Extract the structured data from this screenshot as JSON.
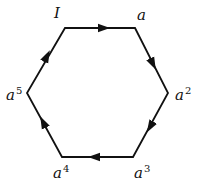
{
  "diagram": {
    "type": "directed-cycle-hexagon",
    "stroke_color": "#111111",
    "vertices": [
      {
        "id": "v0",
        "label": "I",
        "exp": "",
        "x": 65,
        "y": 28
      },
      {
        "id": "v1",
        "label": "a",
        "exp": "",
        "x": 135,
        "y": 28
      },
      {
        "id": "v2",
        "label": "a",
        "exp": "2",
        "x": 168,
        "y": 93
      },
      {
        "id": "v3",
        "label": "a",
        "exp": "3",
        "x": 133,
        "y": 157
      },
      {
        "id": "v4",
        "label": "a",
        "exp": "4",
        "x": 62,
        "y": 157
      },
      {
        "id": "v5",
        "label": "a",
        "exp": "5",
        "x": 27,
        "y": 93
      }
    ],
    "edges": [
      {
        "from": "I",
        "to": "a"
      },
      {
        "from": "a",
        "to": "a^2"
      },
      {
        "from": "a^2",
        "to": "a^3"
      },
      {
        "from": "a^3",
        "to": "a^4"
      },
      {
        "from": "a^4",
        "to": "a^5"
      },
      {
        "from": "a^5",
        "to": "I"
      }
    ]
  }
}
